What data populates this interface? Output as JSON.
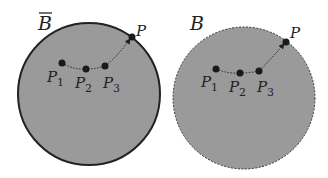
{
  "colors": {
    "fill": "#9a9a9a",
    "stroke": "#222222",
    "point": "#1a1a1a"
  },
  "panels": [
    {
      "name": "closed-ball",
      "set_label": "B̄",
      "boundary": "solid",
      "points": [
        {
          "label": "P",
          "sub": "1"
        },
        {
          "label": "P",
          "sub": "2"
        },
        {
          "label": "P",
          "sub": "3"
        },
        {
          "label": "P",
          "sub": ""
        }
      ]
    },
    {
      "name": "open-ball",
      "set_label": "B",
      "boundary": "dashed",
      "points": [
        {
          "label": "P",
          "sub": "1"
        },
        {
          "label": "P",
          "sub": "2"
        },
        {
          "label": "P",
          "sub": "3"
        },
        {
          "label": "P",
          "sub": ""
        }
      ]
    }
  ]
}
